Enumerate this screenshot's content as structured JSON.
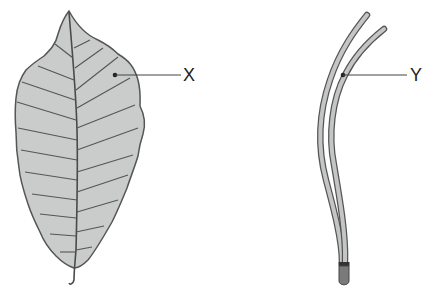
{
  "diagram": {
    "specimens": [
      {
        "id": "broad-leaf",
        "label": "X"
      },
      {
        "id": "pine-needles",
        "label": "Y"
      }
    ],
    "colors": {
      "leaf_fill": "#c9cccb",
      "outline": "#555555",
      "needle_fill": "#c4c6c5",
      "sheath": "#7a7a7a",
      "label_line": "#444444"
    }
  }
}
